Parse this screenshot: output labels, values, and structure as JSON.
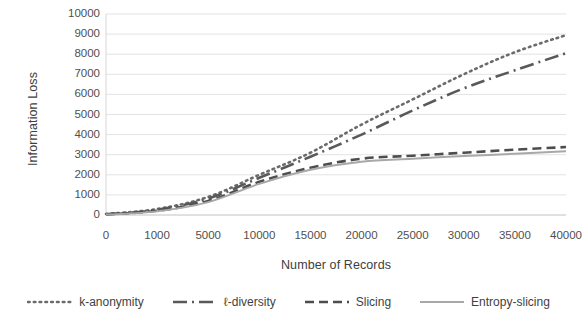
{
  "chart_data": {
    "type": "line",
    "title": "",
    "xlabel": "Number of Records",
    "ylabel": "Information Loss",
    "categories": [
      "0",
      "1000",
      "5000",
      "10000",
      "15000",
      "20000",
      "25000",
      "30000",
      "35000",
      "40000"
    ],
    "ylim": [
      0,
      10000
    ],
    "yticks": [
      "0",
      "1000",
      "2000",
      "3000",
      "4000",
      "5000",
      "6000",
      "7000",
      "8000",
      "9000",
      "10000"
    ],
    "grid": true,
    "legend_position": "bottom",
    "series": [
      {
        "name": "k-anonymity",
        "style": "dotted",
        "color": "#6b6b6b",
        "values": [
          50,
          300,
          900,
          2000,
          3100,
          4500,
          5750,
          7000,
          8100,
          8950
        ]
      },
      {
        "name": "ℓ-diversity",
        "style": "dash-dot",
        "color": "#595959",
        "values": [
          40,
          260,
          820,
          1850,
          2900,
          4000,
          5200,
          6300,
          7200,
          8050
        ]
      },
      {
        "name": "Slicing",
        "style": "dashed",
        "color": "#4d4d4d",
        "values": [
          30,
          210,
          700,
          1650,
          2350,
          2800,
          2950,
          3100,
          3250,
          3380
        ]
      },
      {
        "name": "Entropy-slicing",
        "style": "solid",
        "color": "#a8a8a8",
        "values": [
          20,
          180,
          640,
          1550,
          2250,
          2650,
          2800,
          2930,
          3050,
          3170
        ]
      }
    ]
  },
  "legend": {
    "items": [
      {
        "label": "k-anonymity",
        "swatch": "dotted-line-swatch"
      },
      {
        "label": "ℓ-diversity",
        "swatch": "dash-dot-line-swatch"
      },
      {
        "label": "Slicing",
        "swatch": "dashed-line-swatch"
      },
      {
        "label": "Entropy-slicing",
        "swatch": "solid-line-swatch"
      }
    ]
  }
}
